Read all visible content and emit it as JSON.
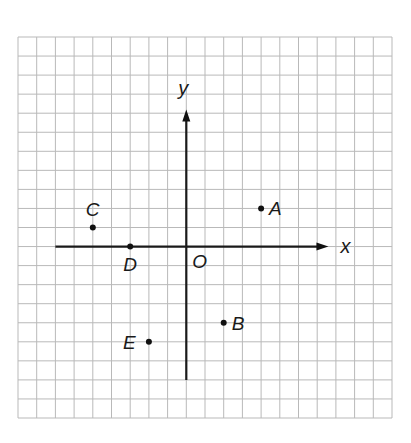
{
  "diagram": {
    "type": "coordinate-plane",
    "grid": {
      "columns": 20,
      "rows": 20,
      "left": 18,
      "top": 37,
      "cell_w": 18.7,
      "cell_h": 19.05,
      "line_color": "#b9b9b9"
    },
    "origin": {
      "col": 9,
      "row": 11,
      "label": "O"
    },
    "axes": {
      "x": {
        "label": "x",
        "from": -7,
        "to": 7.6
      },
      "y": {
        "label": "y",
        "from": -7,
        "to": 7.2
      }
    },
    "points": [
      {
        "name": "A",
        "x": 4,
        "y": 2,
        "label_side": "right"
      },
      {
        "name": "B",
        "x": 2,
        "y": -4,
        "label_side": "right"
      },
      {
        "name": "C",
        "x": -5,
        "y": 1,
        "label_side": "above"
      },
      {
        "name": "D",
        "x": -3,
        "y": 0,
        "label_side": "below"
      },
      {
        "name": "E",
        "x": -2,
        "y": -5,
        "label_side": "left"
      }
    ]
  }
}
